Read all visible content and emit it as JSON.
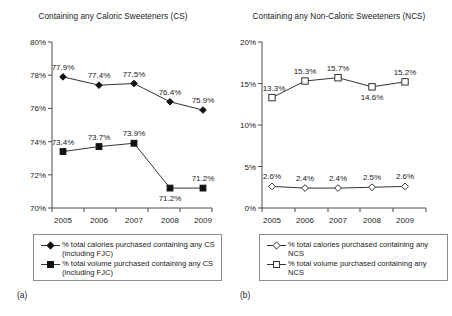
{
  "figure": {
    "panel_a_letter": "(a)",
    "panel_b_letter": "(b)"
  },
  "chart_data": [
    {
      "panel": "a",
      "type": "line",
      "title": "Containing any Caloric Sweeteners (CS)",
      "xlabel": "",
      "ylabel": "",
      "x": [
        "2005",
        "2006",
        "2007",
        "2008",
        "2009"
      ],
      "categories": [
        "2005",
        "2006",
        "2007",
        "2008",
        "2009"
      ],
      "ylim": [
        70,
        80
      ],
      "yticks": [
        "70%",
        "72%",
        "74%",
        "76%",
        "78%",
        "80%"
      ],
      "ytick_values": [
        70,
        72,
        74,
        76,
        78,
        80
      ],
      "grid": false,
      "legend_position": "below",
      "series": [
        {
          "name": "% total calories purchased containing any CS (including FJC)",
          "marker": "filled-diamond",
          "values": [
            77.9,
            77.4,
            77.5,
            76.4,
            75.9
          ],
          "labels": [
            "77.9%",
            "77.4%",
            "77.5%",
            "76.4%",
            "75.9%"
          ],
          "label_positions": [
            "above",
            "above",
            "above",
            "above",
            "above"
          ]
        },
        {
          "name": "% total volume purchased containing any CS (including FJC)",
          "marker": "filled-square",
          "values": [
            73.4,
            73.7,
            73.9,
            71.2,
            71.2
          ],
          "labels": [
            "73.4%",
            "73.7%",
            "73.9%",
            "71.2%",
            "71.2%"
          ],
          "label_positions": [
            "above",
            "above",
            "above",
            "below",
            "above"
          ]
        }
      ]
    },
    {
      "panel": "b",
      "type": "line",
      "title": "Containing any Non-Caloric Sweeteners (NCS)",
      "xlabel": "",
      "ylabel": "",
      "x": [
        "2005",
        "2006",
        "2007",
        "2008",
        "2009"
      ],
      "categories": [
        "2005",
        "2006",
        "2007",
        "2008",
        "2009"
      ],
      "ylim": [
        0,
        20
      ],
      "yticks": [
        "0%",
        "5%",
        "10%",
        "15%",
        "20%"
      ],
      "ytick_values": [
        0,
        5,
        10,
        15,
        20
      ],
      "grid": false,
      "legend_position": "below",
      "series": [
        {
          "name": "% total calories purchased containing any NCS",
          "marker": "open-diamond",
          "values": [
            2.6,
            2.4,
            2.4,
            2.5,
            2.6
          ],
          "labels": [
            "2.6%",
            "2.4%",
            "2.4%",
            "2.5%",
            "2.6%"
          ],
          "label_positions": [
            "above",
            "above",
            "above",
            "above",
            "above"
          ]
        },
        {
          "name": "% total volume purchased containing any NCS",
          "marker": "open-square",
          "values": [
            13.3,
            15.3,
            15.7,
            14.6,
            15.2
          ],
          "labels": [
            "13.3%",
            "15.3%",
            "15.7%",
            "14.6%",
            "15.2%"
          ],
          "label_positions": [
            "above-left",
            "above",
            "above",
            "below",
            "above"
          ]
        }
      ]
    }
  ]
}
